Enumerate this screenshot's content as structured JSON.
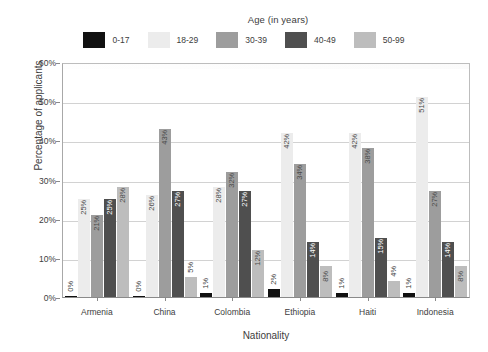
{
  "legend": {
    "title": "Age (in years)",
    "items": [
      {
        "label": "0-17",
        "color": "#111111"
      },
      {
        "label": "18-29",
        "color": "#ececec"
      },
      {
        "label": "30-39",
        "color": "#9d9d9d"
      },
      {
        "label": "40-49",
        "color": "#4f4f4f"
      },
      {
        "label": "50-99",
        "color": "#bdbdbd"
      }
    ]
  },
  "axes": {
    "ylabel": "Percentage of applicants",
    "xlabel": "Nationality",
    "yticks": [
      "0%",
      "10%",
      "20%",
      "30%",
      "40%",
      "50%",
      "60%"
    ]
  },
  "chart_data": {
    "type": "bar",
    "title": "",
    "xlabel": "Nationality",
    "ylabel": "Percentage of applicants",
    "ylim": [
      0,
      60
    ],
    "ytick_values": [
      0,
      10,
      20,
      30,
      40,
      50,
      60
    ],
    "ytick_labels": [
      "0%",
      "10%",
      "20%",
      "30%",
      "40%",
      "50%",
      "60%"
    ],
    "grid": true,
    "legend_position": "top",
    "legend_title": "Age (in years)",
    "categories": [
      "Armenia",
      "China",
      "Colombia",
      "Ethiopia",
      "Haiti",
      "Indonesia"
    ],
    "series": [
      {
        "name": "0-17",
        "color": "#111111",
        "values": [
          0,
          0,
          1,
          2,
          1,
          1
        ],
        "labels": [
          "0%",
          "0%",
          "1%",
          "2%",
          "1%",
          "1%"
        ]
      },
      {
        "name": "18-29",
        "color": "#ececec",
        "values": [
          25,
          26,
          28,
          42,
          42,
          51
        ],
        "labels": [
          "25%",
          "26%",
          "28%",
          "42%",
          "42%",
          "51%"
        ]
      },
      {
        "name": "30-39",
        "color": "#9d9d9d",
        "values": [
          21,
          43,
          32,
          34,
          38,
          27
        ],
        "labels": [
          "21%",
          "43%",
          "32%",
          "34%",
          "38%",
          "27%"
        ]
      },
      {
        "name": "40-49",
        "color": "#4f4f4f",
        "values": [
          25,
          27,
          27,
          14,
          15,
          14
        ],
        "labels": [
          "25%",
          "27%",
          "27%",
          "14%",
          "15%",
          "14%"
        ]
      },
      {
        "name": "50-99",
        "color": "#bdbdbd",
        "values": [
          28,
          5,
          12,
          8,
          4,
          8
        ],
        "labels": [
          "28%",
          "5%",
          "12%",
          "8%",
          "4%",
          "8%"
        ]
      }
    ]
  }
}
